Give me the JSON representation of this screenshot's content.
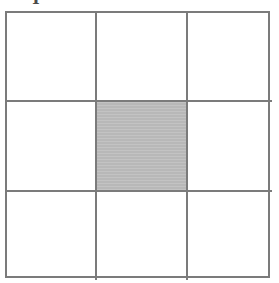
{
  "figure": {
    "label_fragment": "I",
    "line_color": "#7b7b7b",
    "shade_color": "#b8b8b8",
    "background_color": "#ffffff"
  },
  "grid": {
    "rows": 3,
    "columns": 3,
    "shaded_cells": [
      "r2c2"
    ],
    "cells": [
      {
        "id": "r1c1",
        "row": 1,
        "column": 1,
        "shaded": false,
        "label": ""
      },
      {
        "id": "r1c2",
        "row": 1,
        "column": 2,
        "shaded": false,
        "label": ""
      },
      {
        "id": "r1c3",
        "row": 1,
        "column": 3,
        "shaded": false,
        "label": ""
      },
      {
        "id": "r2c1",
        "row": 2,
        "column": 1,
        "shaded": false,
        "label": ""
      },
      {
        "id": "r2c2",
        "row": 2,
        "column": 2,
        "shaded": true,
        "label": ""
      },
      {
        "id": "r2c3",
        "row": 2,
        "column": 3,
        "shaded": false,
        "label": ""
      },
      {
        "id": "r3c1",
        "row": 3,
        "column": 1,
        "shaded": false,
        "label": ""
      },
      {
        "id": "r3c2",
        "row": 3,
        "column": 2,
        "shaded": false,
        "label": ""
      },
      {
        "id": "r3c3",
        "row": 3,
        "column": 3,
        "shaded": false,
        "label": ""
      }
    ]
  }
}
